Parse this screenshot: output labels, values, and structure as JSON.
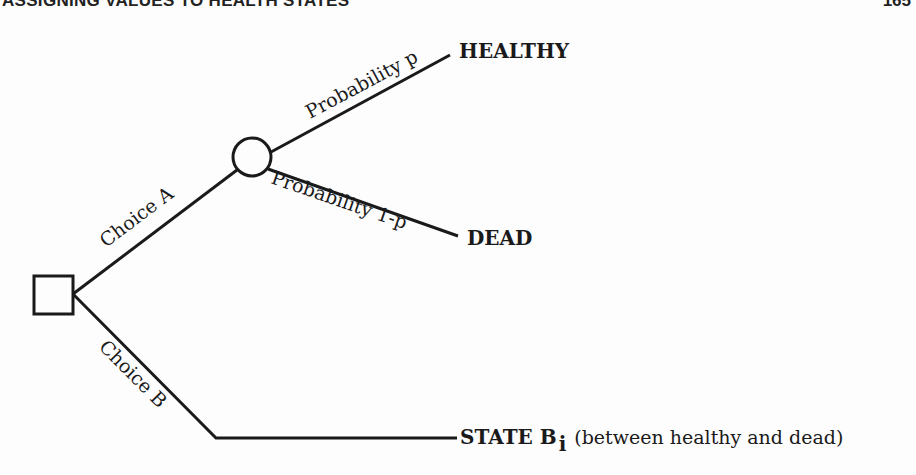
{
  "header": {
    "title": "ASSIGNING VALUES TO HEALTH STATES",
    "page_number": "165"
  },
  "diagram": {
    "type": "decision-tree",
    "decision_node": {
      "shape": "square"
    },
    "chance_node": {
      "shape": "circle"
    },
    "branches": {
      "choice_a": "Choice A",
      "choice_b": "Choice B",
      "prob_p": "Probability p",
      "prob_1p": "Probability 1-p"
    },
    "outcomes": {
      "healthy": "HEALTHY",
      "dead": "DEAD",
      "state_b": "STATE B",
      "state_b_subscript": "i",
      "state_b_note": "(between healthy and dead)"
    }
  }
}
